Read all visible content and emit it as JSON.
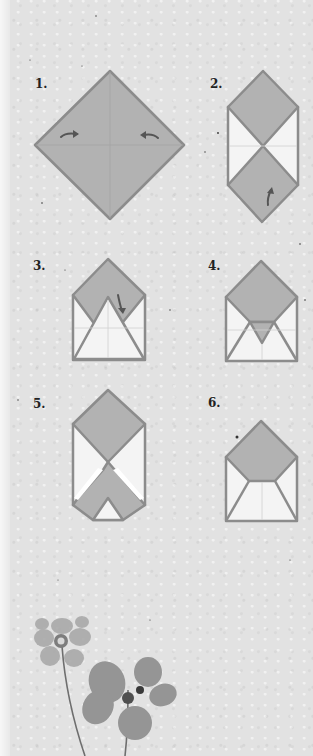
{
  "colors": {
    "paper_fill": "#b2b2b2",
    "paper_white": "#f4f4f4",
    "stroke": "#8c8c8c",
    "arrow": "#555555",
    "background": "#e2e2e2",
    "label": "#222222"
  },
  "steps": [
    {
      "label": "1.",
      "description": "Square sheet turned as a diamond; fold left and right corners to center"
    },
    {
      "label": "2.",
      "description": "Side corners folded in; fold bottom point up"
    },
    {
      "label": "3.",
      "description": "Bottom folded up as triangle; fold top flap down"
    },
    {
      "label": "4.",
      "description": "Top flap tucked into pocket forming small triangle"
    },
    {
      "label": "5.",
      "description": "Alternative: bottom flap folded up with notch"
    },
    {
      "label": "6.",
      "description": "Finished envelope with pentagon flap"
    }
  ],
  "decoration": {
    "name": "pressed-flowers",
    "items": [
      "clover-flower",
      "pansy-flower"
    ]
  }
}
